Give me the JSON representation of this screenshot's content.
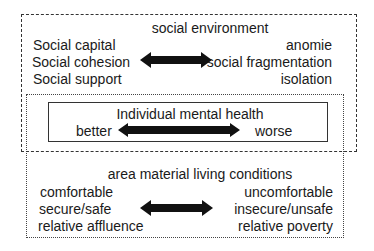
{
  "diagram": {
    "social_environment": {
      "title": "social environment",
      "positive": [
        "Social capital",
        "Social cohesion",
        "Social support"
      ],
      "negative": [
        "anomie",
        "social fragmentation",
        "isolation"
      ],
      "border_style": "dashed"
    },
    "individual_mental_health": {
      "title": "Individual mental health",
      "positive": "better",
      "negative": "worse",
      "border_style": "solid"
    },
    "area_material_living_conditions": {
      "title": "area material living conditions",
      "positive": [
        "comfortable",
        "secure/safe",
        "relative affluence"
      ],
      "negative": [
        "uncomfortable",
        "insecure/unsafe",
        "relative poverty"
      ],
      "border_style": "dotted"
    },
    "arrow_icon": "double-headed-arrow",
    "colors": {
      "text": "#1a1a1a",
      "arrow": "#111111",
      "border": "#333333",
      "background": "#ffffff"
    }
  }
}
